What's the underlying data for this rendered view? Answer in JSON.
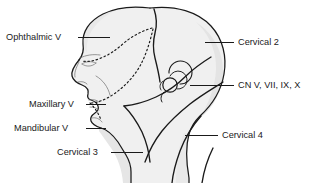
{
  "figure": {
    "type": "anatomical-diagram",
    "colors": {
      "background": "#ffffff",
      "outline": "#1a1a1a",
      "skin_fill": "#f0f0f0",
      "shade_fill": "#e3e3e3",
      "label_text": "#1a1a1a",
      "leader_line": "#1a1a1a",
      "dotted_boundary": "#1a1a1a"
    },
    "labels": [
      {
        "id": "ophthalmic-v",
        "text": "Ophthalmic V",
        "side": "left",
        "text_x": 6,
        "text_y": 33,
        "leader": {
          "x1": 78,
          "y1": 37.5,
          "x2": 110,
          "y2": 37.5
        }
      },
      {
        "id": "cervical-2",
        "text": "Cervical 2",
        "side": "right",
        "text_x": 238,
        "text_y": 38,
        "leader": {
          "x1": 205,
          "y1": 42.5,
          "x2": 234,
          "y2": 42.5
        }
      },
      {
        "id": "cn-v-vii-ix-x",
        "text": "CN V, VII, IX, X",
        "side": "right",
        "text_x": 238,
        "text_y": 81,
        "leader": {
          "x1": 190,
          "y1": 85.5,
          "x2": 234,
          "y2": 85.5
        }
      },
      {
        "id": "maxillary-v",
        "text": "Maxillary V",
        "side": "left",
        "text_x": 29,
        "text_y": 100,
        "leader": {
          "x1": 86,
          "y1": 104.5,
          "x2": 106,
          "y2": 104.5
        }
      },
      {
        "id": "mandibular-v",
        "text": "Mandibular V",
        "side": "left",
        "text_x": 14,
        "text_y": 124,
        "leader": {
          "x1": 86,
          "y1": 128.5,
          "x2": 106,
          "y2": 128.5
        }
      },
      {
        "id": "cervical-3",
        "text": "Cervical 3",
        "side": "left",
        "text_x": 57,
        "text_y": 148,
        "leader": {
          "x1": 111,
          "y1": 152.5,
          "x2": 143,
          "y2": 152.5
        }
      },
      {
        "id": "cervical-4",
        "text": "Cervical 4",
        "side": "right",
        "text_x": 222,
        "text_y": 131,
        "leader": {
          "x1": 185,
          "y1": 135.5,
          "x2": 218,
          "y2": 135.5
        }
      }
    ],
    "regions": [
      "Ophthalmic division of trigeminal nerve (V1)",
      "Maxillary division of trigeminal nerve (V2)",
      "Mandibular division of trigeminal nerve (V3)",
      "Cervical 2 dermatome",
      "Cervical 3 dermatome",
      "Cervical 4 dermatome",
      "Cranial nerves V, VII, IX, X convergence at external ear"
    ],
    "features": {
      "ear": "external-ear-spiral",
      "profile": "left-facing-lateral-head-profile",
      "boundary_style_trigeminal": "dotted",
      "boundary_style_cervical": "solid"
    }
  }
}
